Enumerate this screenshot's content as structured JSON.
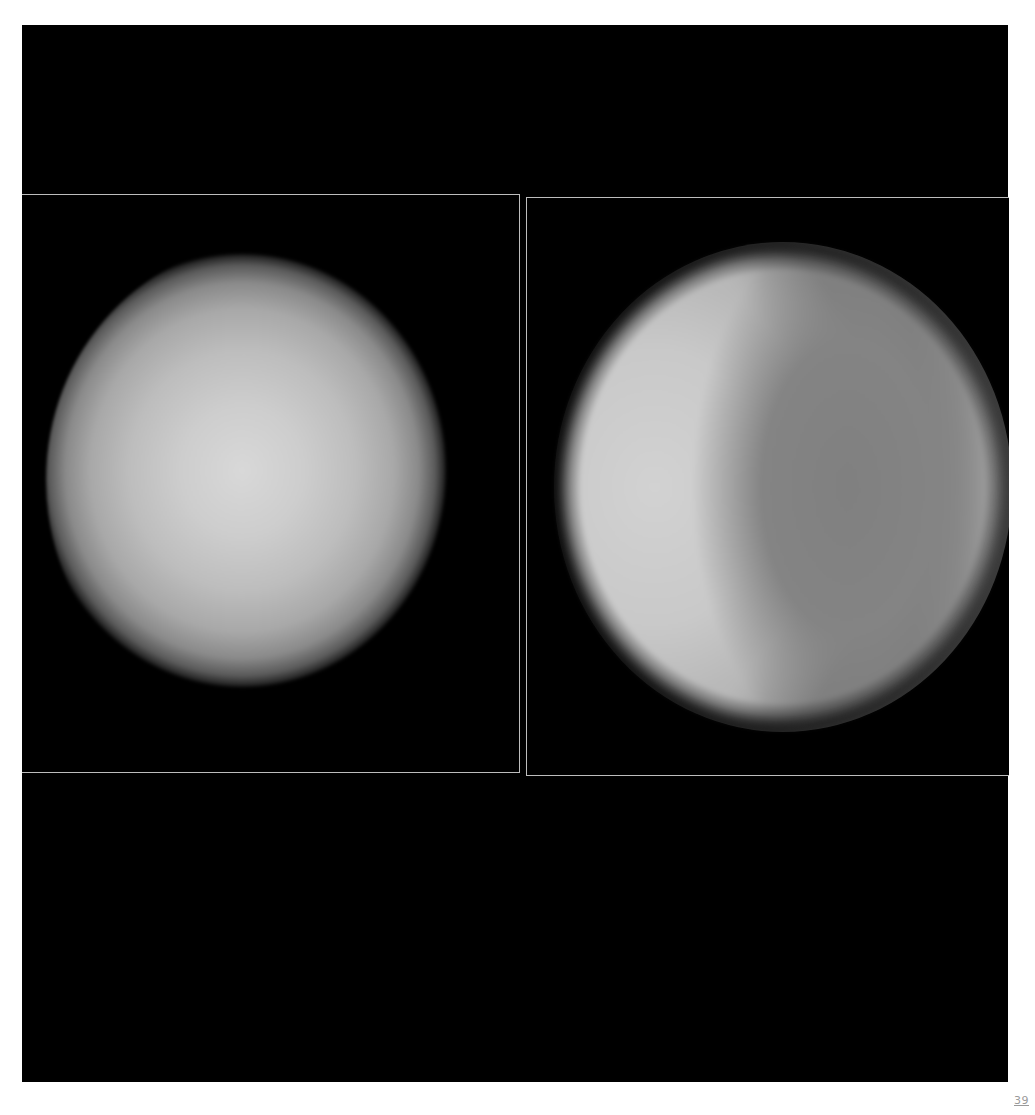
{
  "page": {
    "background": "#ffffff",
    "plate_color": "#000000",
    "border_color": "#bdbdbd",
    "page_number": "39"
  },
  "panels": [
    {
      "id": "left",
      "subject": "planet-disk-uniform",
      "description": "Uniformly lit planetary disk with limb darkening"
    },
    {
      "id": "right",
      "subject": "planet-disk-banded",
      "description": "Planetary disk with bright left hemisphere and darker band"
    }
  ]
}
